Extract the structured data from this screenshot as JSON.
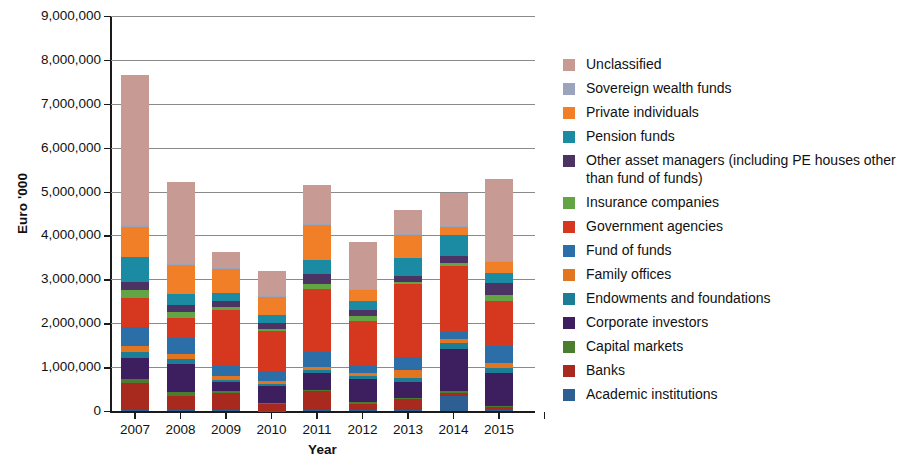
{
  "chart_data": {
    "type": "bar",
    "subtype": "stacked-vertical",
    "title": "",
    "xlabel": "Year",
    "ylabel": "Euro '000",
    "grid": true,
    "legend_position": "right",
    "ylim": [
      0,
      9000000
    ],
    "ytick_step": 1000000,
    "ytick_labels": [
      "0",
      "1,000,000",
      "2,000,000",
      "3,000,000",
      "4,000,000",
      "5,000,000",
      "6,000,000",
      "7,000,000",
      "8,000,000",
      "9,000,000"
    ],
    "ytick_values": [
      0,
      1000000,
      2000000,
      3000000,
      4000000,
      5000000,
      6000000,
      7000000,
      8000000,
      9000000
    ],
    "categories": [
      "2007",
      "2008",
      "2009",
      "2010",
      "2011",
      "2012",
      "2013",
      "2014",
      "2015"
    ],
    "stack_order_bottom_to_top": [
      "Academic institutions",
      "Banks",
      "Capital markets",
      "Corporate investors",
      "Endowments and foundations",
      "Family offices",
      "Fund of funds",
      "Government agencies",
      "Insurance companies",
      "Other asset managers (including PE houses other than fund of funds)",
      "Pension funds",
      "Private individuals",
      "Sovereign wealth funds",
      "Unclassified"
    ],
    "series": [
      {
        "name": "Academic institutions",
        "color": "#2e5f92",
        "values": [
          20000,
          15000,
          15000,
          10000,
          30000,
          20000,
          30000,
          340000,
          25000
        ]
      },
      {
        "name": "Banks",
        "color": "#a82a1e",
        "values": [
          610000,
          330000,
          390000,
          140000,
          420000,
          150000,
          240000,
          80000,
          60000
        ]
      },
      {
        "name": "Capital markets",
        "color": "#4b7c2f",
        "values": [
          100000,
          90000,
          40000,
          30000,
          40000,
          30000,
          30000,
          40000,
          20000
        ]
      },
      {
        "name": "Corporate investors",
        "color": "#3d1e5e",
        "values": [
          480000,
          630000,
          210000,
          390000,
          370000,
          540000,
          370000,
          960000,
          770000
        ]
      },
      {
        "name": "Endowments and foundations",
        "color": "#1b7e96",
        "values": [
          140000,
          120000,
          60000,
          50000,
          70000,
          60000,
          80000,
          130000,
          110000
        ]
      },
      {
        "name": "Family offices",
        "color": "#e2751f",
        "values": [
          120000,
          110000,
          80000,
          60000,
          80000,
          60000,
          180000,
          90000,
          100000
        ]
      },
      {
        "name": "Fund of funds",
        "color": "#2c6ea8",
        "values": [
          440000,
          370000,
          230000,
          230000,
          340000,
          170000,
          290000,
          170000,
          390000
        ]
      },
      {
        "name": "Government agencies",
        "color": "#d6371f",
        "values": [
          660000,
          460000,
          1280000,
          910000,
          1440000,
          1020000,
          1670000,
          1490000,
          1040000
        ]
      },
      {
        "name": "Insurance companies",
        "color": "#63a544",
        "values": [
          180000,
          130000,
          70000,
          60000,
          100000,
          120000,
          60000,
          70000,
          120000
        ]
      },
      {
        "name": "Other asset managers (including PE houses other than fund of funds)",
        "color": "#4b3363",
        "values": [
          180000,
          170000,
          130000,
          120000,
          230000,
          140000,
          130000,
          160000,
          290000
        ]
      },
      {
        "name": "Pension funds",
        "color": "#1b8ba4",
        "values": [
          570000,
          240000,
          180000,
          180000,
          330000,
          200000,
          400000,
          470000,
          230000
        ]
      },
      {
        "name": "Private individuals",
        "color": "#f07f28",
        "values": [
          700000,
          660000,
          560000,
          430000,
          780000,
          250000,
          530000,
          190000,
          250000
        ]
      },
      {
        "name": "Sovereign wealth funds",
        "color": "#9aa5bd",
        "values": [
          30000,
          30000,
          20000,
          20000,
          20000,
          20000,
          30000,
          30000,
          20000
        ]
      },
      {
        "name": "Unclassified",
        "color": "#c79a94",
        "values": [
          3420000,
          1870000,
          350000,
          550000,
          900000,
          1070000,
          530000,
          750000,
          1860000
        ]
      }
    ],
    "totals": [
      8140000,
      6200000,
      3600000,
      3180000,
      5170000,
      3830000,
      4570000,
      4960000,
      5280000
    ]
  },
  "legend": {
    "items": [
      {
        "label": "Unclassified",
        "color": "#c79a94"
      },
      {
        "label": "Sovereign wealth funds",
        "color": "#9aa5bd"
      },
      {
        "label": "Private individuals",
        "color": "#f07f28"
      },
      {
        "label": "Pension funds",
        "color": "#1b8ba4"
      },
      {
        "label": "Other asset managers (including PE houses other than fund of funds)",
        "color": "#4b3363"
      },
      {
        "label": "Insurance companies",
        "color": "#63a544"
      },
      {
        "label": "Government agencies",
        "color": "#d6371f"
      },
      {
        "label": "Fund of funds",
        "color": "#2c6ea8"
      },
      {
        "label": "Family offices",
        "color": "#e2751f"
      },
      {
        "label": "Endowments and foundations",
        "color": "#1b7e96"
      },
      {
        "label": "Corporate investors",
        "color": "#3d1e5e"
      },
      {
        "label": "Capital markets",
        "color": "#4b7c2f"
      },
      {
        "label": "Banks",
        "color": "#a82a1e"
      },
      {
        "label": "Academic institutions",
        "color": "#2e5f92"
      }
    ]
  },
  "axis_titles": {
    "y": "Euro '000",
    "x": "Year"
  }
}
